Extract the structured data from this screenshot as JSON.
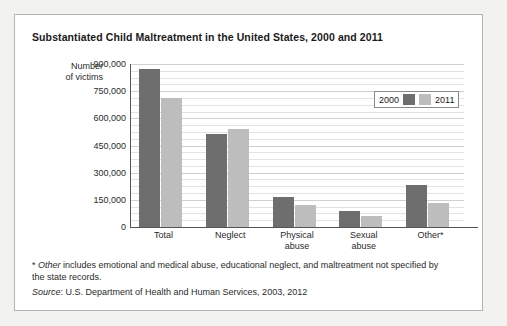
{
  "chart_data": {
    "type": "bar",
    "title": "Substantiated Child Maltreatment in the United States, 2000 and 2011",
    "xlabel": "",
    "ylabel": "Number of victims",
    "ylim": [
      0,
      900000
    ],
    "ytick_labels": [
      "900,000",
      "750,000",
      "600,000",
      "450,000",
      "300,000",
      "150,000",
      "0"
    ],
    "ytick_values": [
      900000,
      750000,
      600000,
      450000,
      300000,
      150000,
      0
    ],
    "grid": true,
    "legend_position": "top-right",
    "categories": [
      "Total",
      "Neglect",
      "Physical abuse",
      "Sexual abuse",
      "Other*"
    ],
    "series": [
      {
        "name": "2000",
        "color": "#6e6e6e",
        "values": [
          872000,
          513000,
          167000,
          89000,
          231000
        ]
      },
      {
        "name": "2011",
        "color": "#bdbdbd",
        "values": [
          710000,
          542000,
          124000,
          63000,
          132000
        ]
      }
    ]
  },
  "figure": {
    "title": "Substantiated Child Maltreatment in the United States, 2000 and 2011",
    "y_axis_title_line1": "Number",
    "y_axis_title_line2": "of victims",
    "legend": {
      "label_2000": "2000",
      "label_2011": "2011"
    },
    "categories": {
      "c0_line1": "Total",
      "c0_line2": "",
      "c1_line1": "Neglect",
      "c1_line2": "",
      "c2_line1": "Physical",
      "c2_line2": "abuse",
      "c3_line1": "Sexual",
      "c3_line2": "abuse",
      "c4_line1": "Other*",
      "c4_line2": ""
    },
    "footnote": {
      "marker": "*",
      "emphasis": "Other",
      "text": " includes emotional and medical abuse, educational neglect, and maltreatment not specified by the state records."
    },
    "source": {
      "label": "Source",
      "text": ": U.S. Department of Health and Human Services, 2003, 2012"
    }
  }
}
